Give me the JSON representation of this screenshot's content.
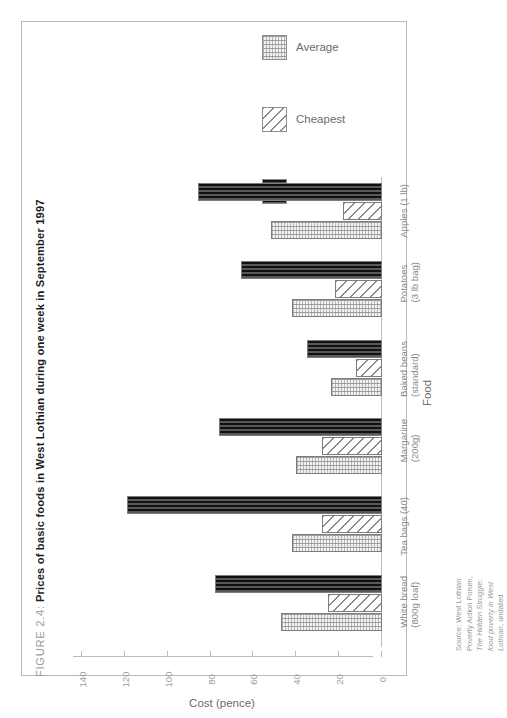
{
  "figure": {
    "label": "FIGURE 2.4:",
    "title": "Prices of basic foods in West Lothian during one week in September 1997"
  },
  "legend": {
    "position": "top-right",
    "items": [
      {
        "label": "Average",
        "pattern": "fine-grid-light",
        "color": "#f2f2f2"
      },
      {
        "label": "Cheapest",
        "pattern": "diagonal-hatch",
        "color": "#ffffff"
      },
      {
        "label": "Dearest",
        "pattern": "dense-dark-grid",
        "color": "#3a3a3a"
      }
    ]
  },
  "source": {
    "prefix": "Source:",
    "org": "West Lothian Poverty Action Forum,",
    "publication": "The Hidden Struggle: food poverty in West Lothian",
    "suffix": ", undated"
  },
  "chart_data": {
    "type": "bar",
    "orientation": "horizontal-rotated",
    "title": "Prices of basic foods in West Lothian during one week in September 1997",
    "xlabel": "Cost (pence)",
    "ylabel": "Food",
    "xlim": [
      0,
      140
    ],
    "xticks": [
      140,
      120,
      100,
      80,
      60,
      40,
      20,
      0
    ],
    "xtick_labels": [
      "140",
      "120",
      "100",
      "80",
      "60",
      "40",
      "20",
      "0"
    ],
    "axis_direction": "value axis decreases left to right; zero at right",
    "grid": false,
    "categories": [
      "Apples (1 lb)",
      "Potatoes (3 lb bag)",
      "Baked beans (standard)",
      "Margarine (200g)",
      "Tea bags (40)",
      "White bread (800g loaf)"
    ],
    "category_labels": [
      {
        "line1": "Apples (1 lb)",
        "line2": ""
      },
      {
        "line1": "Potatoes",
        "line2": "(3 lb bag)"
      },
      {
        "line1": "Baked beans",
        "line2": "(standard)"
      },
      {
        "line1": "Margarine",
        "line2": "(200g)"
      },
      {
        "line1": "Tea bags (40)",
        "line2": ""
      },
      {
        "line1": "White bread",
        "line2": "(800g loaf)"
      }
    ],
    "series": [
      {
        "name": "Dearest",
        "values": [
          86,
          66,
          35,
          76,
          119,
          78
        ]
      },
      {
        "name": "Cheapest",
        "values": [
          18,
          22,
          12,
          28,
          28,
          25
        ]
      },
      {
        "name": "Average",
        "values": [
          52,
          42,
          24,
          40,
          42,
          47
        ]
      }
    ]
  }
}
